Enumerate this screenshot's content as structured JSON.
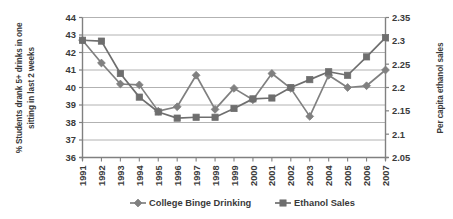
{
  "chart_data": {
    "type": "line",
    "title": "",
    "subtitle": "",
    "xlabel": "",
    "ylabel": "% Students drank 5+ drinks in one sitting in last 2 weeks",
    "y2label": "Per capita ethanol sales",
    "categories": [
      "1991",
      "1992",
      "1993",
      "1994",
      "1995",
      "1996",
      "1997",
      "1998",
      "1999",
      "2000",
      "2001",
      "2002",
      "2003",
      "2004",
      "2005",
      "2006",
      "2007"
    ],
    "ylim": [
      36,
      44
    ],
    "yticks": [
      "36",
      "37",
      "38",
      "39",
      "40",
      "41",
      "42",
      "43",
      "44"
    ],
    "y2lim": [
      2.05,
      2.35
    ],
    "y2ticks": [
      "2.05",
      "2.1",
      "2.15",
      "2.2",
      "2.25",
      "2.3",
      "2.35"
    ],
    "grid": true,
    "legend_position": "bottom",
    "series": [
      {
        "name": "College Binge Drinking",
        "axis": "left",
        "marker": "diamond",
        "color": "#808080",
        "values": [
          42.7,
          41.4,
          40.2,
          40.15,
          38.65,
          38.9,
          40.7,
          38.75,
          39.95,
          39.3,
          40.8,
          39.95,
          38.35,
          40.7,
          40.0,
          40.1,
          41.0
        ]
      },
      {
        "name": "Ethanol Sales",
        "axis": "right",
        "marker": "square",
        "color": "#6e6e6e",
        "values": [
          2.301,
          2.299,
          2.23,
          2.18,
          2.149,
          2.137,
          2.139,
          2.139,
          2.155,
          2.175,
          2.177,
          2.199,
          2.216,
          2.233,
          2.226,
          2.266,
          2.306
        ],
        "values_left_scale": [
          42.7,
          42.65,
          40.8,
          39.45,
          38.6,
          38.25,
          38.3,
          38.3,
          38.8,
          39.35,
          39.4,
          40.0,
          40.45,
          40.9,
          40.7,
          41.75,
          42.85
        ]
      }
    ]
  },
  "legend": {
    "items": [
      {
        "label": "College Binge Drinking",
        "marker": "diamond"
      },
      {
        "label": "Ethanol Sales",
        "marker": "square"
      }
    ]
  }
}
